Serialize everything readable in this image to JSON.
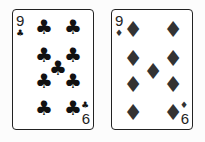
{
  "cards": [
    {
      "rank_top": "9",
      "rank_bottom": "6",
      "suit": "clubs",
      "suit_glyph": "♣",
      "color": "#111111"
    },
    {
      "rank_top": "9",
      "rank_bottom": "6",
      "suit": "diamonds",
      "suit_glyph": "♦",
      "color": "#333333"
    }
  ]
}
